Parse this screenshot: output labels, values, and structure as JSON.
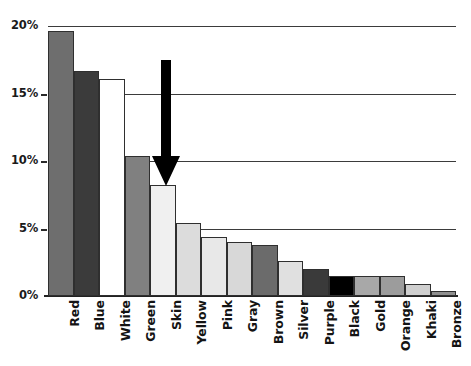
{
  "chart_data": {
    "type": "bar",
    "title": "",
    "subtitle": "",
    "xlabel": "",
    "ylabel": "",
    "grid": true,
    "legend": "none",
    "ylim": [
      0,
      20
    ],
    "ytick_labels": [
      "0%",
      "5%",
      "10%",
      "15%",
      "20%"
    ],
    "ytick_values": [
      0,
      5,
      10,
      15,
      20
    ],
    "categories": [
      "Red",
      "Blue",
      "White",
      "Green",
      "Skin",
      "Yellow",
      "Pink",
      "Gray",
      "Brown",
      "Silver",
      "Purple",
      "Black",
      "Gold",
      "Orange",
      "Khaki",
      "Bronze"
    ],
    "values": [
      19.6,
      16.7,
      16.1,
      10.4,
      8.2,
      5.4,
      4.4,
      4.0,
      3.8,
      2.6,
      2.0,
      1.5,
      1.5,
      1.5,
      0.9,
      0.4
    ],
    "bar_colors": [
      "#6e6e6e",
      "#3b3b3b",
      "#ffffff",
      "#808080",
      "#f0f0f0",
      "#dcdcdc",
      "#e8e8e8",
      "#d8d8d8",
      "#6b6b6b",
      "#e0e0e0",
      "#3a3a3a",
      "#000000",
      "#a8a8a8",
      "#9c9c9c",
      "#cfcfcf",
      "#8f8f8f"
    ],
    "annotations": [
      {
        "name": "down-arrow",
        "points_to_category": "Skin",
        "points_to_value": 8.2,
        "description": "Black downward arrow pointing at the Skin bar"
      }
    ]
  },
  "axis": {
    "tick_color": "#2a2a2a",
    "grid_color": "#3b3b3b",
    "baseline_color": "#222222"
  },
  "annotation": {
    "arrow_color": "#000000"
  }
}
